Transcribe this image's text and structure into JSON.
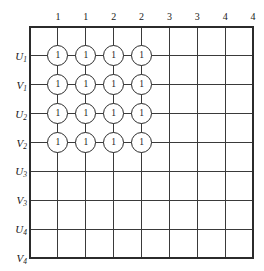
{
  "figure": {
    "name": "bipartite-assignment-grid",
    "grid": {
      "left": 30,
      "top": 27,
      "right": 253,
      "bottom": 258,
      "cols": 8,
      "rows": 8,
      "line_color": "#3a3a3a",
      "border_color": "#2b2b2b"
    },
    "column_headers": [
      "1",
      "1",
      "2",
      "2",
      "3",
      "3",
      "4",
      "4"
    ],
    "row_labels": [
      {
        "letter": "U",
        "sub": "1"
      },
      {
        "letter": "V",
        "sub": "1"
      },
      {
        "letter": "U",
        "sub": "2"
      },
      {
        "letter": "V",
        "sub": "2"
      },
      {
        "letter": "U",
        "sub": "3"
      },
      {
        "letter": "V",
        "sub": "3"
      },
      {
        "letter": "U",
        "sub": "4"
      },
      {
        "letter": "V",
        "sub": "4"
      }
    ],
    "nodes": [
      {
        "row": 0,
        "col": 0,
        "value": "1"
      },
      {
        "row": 0,
        "col": 1,
        "value": "1"
      },
      {
        "row": 0,
        "col": 2,
        "value": "1"
      },
      {
        "row": 0,
        "col": 3,
        "value": "1"
      },
      {
        "row": 1,
        "col": 0,
        "value": "1"
      },
      {
        "row": 1,
        "col": 1,
        "value": "1"
      },
      {
        "row": 1,
        "col": 2,
        "value": "1"
      },
      {
        "row": 1,
        "col": 3,
        "value": "1"
      },
      {
        "row": 2,
        "col": 0,
        "value": "1"
      },
      {
        "row": 2,
        "col": 1,
        "value": "1"
      },
      {
        "row": 2,
        "col": 2,
        "value": "1"
      },
      {
        "row": 2,
        "col": 3,
        "value": "1"
      },
      {
        "row": 3,
        "col": 0,
        "value": "1"
      },
      {
        "row": 3,
        "col": 1,
        "value": "1"
      },
      {
        "row": 3,
        "col": 2,
        "value": "1"
      },
      {
        "row": 3,
        "col": 3,
        "value": "1"
      }
    ]
  }
}
